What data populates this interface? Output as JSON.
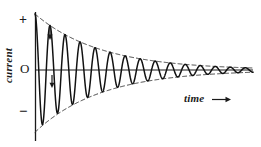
{
  "figure": {
    "background_color": "#ffffff",
    "ink_color": "#1a1a1a",
    "dash_color": "#3a3a3a",
    "width": 261,
    "height": 147
  },
  "axes": {
    "y_axis_label": "current",
    "x_axis_label": "time",
    "x_axis_arrow": "→",
    "tick_positive": "+",
    "tick_zero": "O",
    "tick_negative": "−",
    "y_axis_x_px": 35,
    "zero_line_y_px": 70,
    "y_axis_top_px": 12,
    "y_axis_bottom_px": 140,
    "zero_line_x_end_px": 253
  },
  "annotations": [
    {
      "name": "peak-marker-upper",
      "glyph": "↓",
      "x_px": 50,
      "y_px": 32
    },
    {
      "name": "peak-marker-lower",
      "glyph": "↓",
      "x_px": 52,
      "y_px": 80
    }
  ],
  "chart_data": {
    "type": "line",
    "title": "",
    "xlabel": "time",
    "ylabel": "current",
    "grid": false,
    "legend": false,
    "xlim": [
      0,
      1
    ],
    "ylim": [
      -1.15,
      1.15
    ],
    "model": {
      "form": "A0 * exp(-t / tau) * cos(2*pi*f*t)",
      "amplitude_initial": 1.0,
      "decay_constant_tau": 0.3,
      "cycles_total": 14.5,
      "frequency_cycles_per_unit": 14.5,
      "phase_at_zero": 0
    },
    "series": [
      {
        "name": "current",
        "style": "solid",
        "color": "#1a1a1a",
        "peaks_positive": [
          1.0,
          0.71,
          0.51,
          0.37,
          0.27,
          0.2,
          0.15,
          0.11,
          0.08,
          0.06,
          0.045,
          0.034,
          0.026,
          0.02,
          0.016
        ],
        "peaks_negative": [
          -1.08,
          -0.78,
          -0.56,
          -0.4,
          -0.29,
          -0.21,
          -0.15,
          -0.11,
          -0.08,
          -0.06,
          -0.045,
          -0.034,
          -0.026,
          -0.02
        ]
      },
      {
        "name": "upper-envelope",
        "style": "dashed",
        "color": "#3a3a3a",
        "values": [
          1.0,
          0.72,
          0.52,
          0.37,
          0.27,
          0.19,
          0.14,
          0.1,
          0.07,
          0.05,
          0.04,
          0.03
        ]
      },
      {
        "name": "lower-envelope",
        "style": "dashed",
        "color": "#3a3a3a",
        "values": [
          -1.12,
          -0.8,
          -0.58,
          -0.41,
          -0.3,
          -0.21,
          -0.15,
          -0.11,
          -0.08,
          -0.06,
          -0.045,
          -0.03
        ]
      }
    ]
  }
}
